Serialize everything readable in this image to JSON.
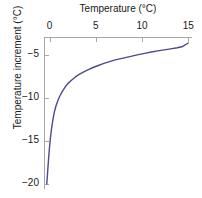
{
  "chart_data": {
    "type": "line",
    "title": "",
    "xlabel": "Temperature (°C)",
    "ylabel": "Temperature increment (°C)",
    "xlim": [
      -0.6,
      15.4
    ],
    "ylim": [
      -20.6,
      -2.9
    ],
    "xticks": [
      0,
      5,
      10,
      15
    ],
    "xticklabels": [
      "0",
      "5",
      "10",
      "15"
    ],
    "yticks": [
      -5,
      -10,
      -15,
      -20
    ],
    "yticklabels": [
      "−5",
      "−10",
      "−15",
      "−20"
    ],
    "xaxis_position": "top",
    "grid": false,
    "legend": null,
    "line_color": "#4b4b8f",
    "axis_color": "#a8a8a8",
    "text_color": "#1a1a1a",
    "background": "#ffffff",
    "series": [
      {
        "name": "temperature increment",
        "x": [
          -0.3,
          -0.25,
          -0.2,
          -0.1,
          0.0,
          0.1,
          0.2,
          0.35,
          0.5,
          0.7,
          0.9,
          1.1,
          1.4,
          1.7,
          2.0,
          2.4,
          2.8,
          3.2,
          3.7,
          4.2,
          4.7,
          5.2,
          5.8,
          6.4,
          7.0,
          7.6,
          8.2,
          8.9,
          9.6,
          10.3,
          11.0,
          11.7,
          12.4,
          13.1,
          13.8,
          14.4,
          15.0
        ],
        "y": [
          -20.0,
          -19.3,
          -18.5,
          -17.0,
          -15.7,
          -14.6,
          -13.7,
          -12.6,
          -11.7,
          -10.9,
          -10.3,
          -9.8,
          -9.2,
          -8.7,
          -8.3,
          -7.9,
          -7.55,
          -7.25,
          -6.95,
          -6.7,
          -6.45,
          -6.25,
          -6.0,
          -5.8,
          -5.6,
          -5.45,
          -5.3,
          -5.12,
          -4.95,
          -4.8,
          -4.65,
          -4.52,
          -4.4,
          -4.28,
          -4.15,
          -4.0,
          -3.6
        ]
      }
    ]
  }
}
